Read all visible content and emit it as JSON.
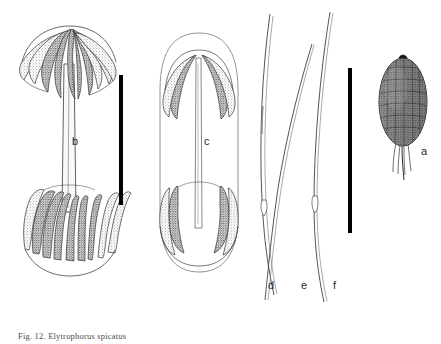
{
  "figure": {
    "type": "botanical-illustration-plate",
    "background_color": "#ffffff",
    "ink_color": "#333333",
    "stipple_color": "#4d4d4d",
    "scalebar_color": "#000000",
    "caption": "Fig. 12.  Elytrophorus spicatus",
    "panels": [
      {
        "id": "a",
        "label": "a",
        "label_x": 421,
        "label_y": 146,
        "description": "caryopsis, densely stippled ellipsoid with basal hair tuft"
      },
      {
        "id": "b",
        "label": "b",
        "label_x": 72,
        "label_y": 136,
        "description": "spikelet cluster, open, with flared crowns of lanceolate scales at both ends"
      },
      {
        "id": "c",
        "label": "c",
        "label_x": 204,
        "label_y": 136,
        "description": "spikelet cluster, closed, scales incurved within a membranous outline"
      },
      {
        "id": "d",
        "label": "d",
        "label_x": 268,
        "label_y": 280,
        "description": "slender curved bristle / awn"
      },
      {
        "id": "e",
        "label": "e",
        "label_x": 301,
        "label_y": 280,
        "description": "slender curved bristle / awn"
      },
      {
        "id": "f",
        "label": "f",
        "label_x": 333,
        "label_y": 280,
        "description": "slender curved bristle / awn"
      }
    ],
    "scale_bars": [
      {
        "id": "scale-bar-left",
        "x": 121,
        "y_top": 75,
        "y_bottom": 205,
        "width": 4
      },
      {
        "id": "scale-bar-right",
        "x": 350,
        "y_top": 68,
        "y_bottom": 233,
        "width": 4
      }
    ]
  }
}
